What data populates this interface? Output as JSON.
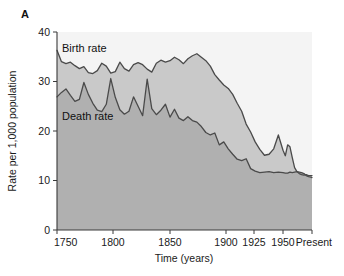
{
  "figure": {
    "panel_label": "A",
    "colors": {
      "plot_background": "#f4f4f4",
      "area_below_death": "#b0b0b0",
      "band_between": "#c9c9c9",
      "line": "#4a4a4a",
      "axis": "#3a3a3a",
      "text": "#1a1a1a"
    }
  },
  "chart_data": {
    "type": "area",
    "title": "",
    "subtitle": "",
    "xlabel": "Time (years)",
    "ylabel": "Rate per 1,000 population",
    "grid": false,
    "legend_position": "inline-annotations",
    "ylim": [
      0,
      40
    ],
    "yticks": [
      0,
      10,
      20,
      30,
      40
    ],
    "ytick_labels": [
      "0",
      "10",
      "20",
      "30",
      "40"
    ],
    "xtick_labels": [
      "1750",
      "1800",
      "1850",
      "1900",
      "1925",
      "1950",
      "Present"
    ],
    "xtick_values": [
      1750,
      1800,
      1850,
      1900,
      1925,
      1950,
      2000
    ],
    "xtick_positions_px": [
      57,
      113,
      170,
      226,
      254,
      283,
      312
    ],
    "x_axis_note": "non-linear: 50-year steps to 1900, then 25-year steps",
    "annotations": [
      {
        "name": "birth-rate-label",
        "text": "Birth rate",
        "x_px": 62,
        "y_px": 52
      },
      {
        "name": "death-rate-label",
        "text": "Death rate",
        "x_px": 62,
        "y_px": 120
      }
    ],
    "series": [
      {
        "name": "Birth rate",
        "label": "Birth rate",
        "x": [
          1750,
          1754,
          1758,
          1762,
          1766,
          1770,
          1774,
          1778,
          1782,
          1786,
          1790,
          1794,
          1798,
          1802,
          1806,
          1810,
          1814,
          1818,
          1822,
          1826,
          1830,
          1834,
          1838,
          1842,
          1846,
          1850,
          1854,
          1858,
          1862,
          1866,
          1870,
          1874,
          1878,
          1882,
          1886,
          1890,
          1894,
          1898,
          1902,
          1906,
          1910,
          1914,
          1918,
          1922,
          1926,
          1930,
          1934,
          1938,
          1942,
          1946,
          1950,
          1954,
          1958,
          1962,
          1966,
          1970,
          1974,
          1978,
          1982,
          1986,
          1990,
          1994,
          1998,
          2000
        ],
        "values": [
          36.3,
          34.0,
          33.6,
          33.9,
          33.2,
          32.6,
          33.0,
          31.8,
          31.6,
          32.2,
          33.7,
          33.1,
          31.7,
          32.0,
          33.9,
          32.6,
          32.1,
          33.4,
          33.8,
          33.4,
          32.5,
          31.9,
          33.7,
          34.3,
          33.9,
          34.2,
          34.9,
          34.4,
          33.6,
          34.6,
          35.2,
          35.6,
          34.9,
          34.2,
          33.1,
          31.4,
          30.3,
          29.3,
          28.6,
          27.4,
          25.6,
          24.0,
          21.4,
          19.8,
          17.8,
          16.3,
          15.1,
          15.3,
          16.4,
          19.2,
          16.1,
          15.0,
          17.2,
          16.8,
          14.6,
          12.6,
          11.8,
          11.4,
          11.2,
          11.1,
          11.2,
          11.0,
          11.0,
          11.0
        ]
      },
      {
        "name": "Death rate",
        "label": "Death rate",
        "x": [
          1750,
          1754,
          1758,
          1762,
          1766,
          1770,
          1774,
          1778,
          1782,
          1786,
          1790,
          1794,
          1798,
          1802,
          1806,
          1810,
          1814,
          1818,
          1822,
          1826,
          1830,
          1834,
          1838,
          1842,
          1846,
          1850,
          1854,
          1858,
          1862,
          1866,
          1870,
          1874,
          1878,
          1882,
          1886,
          1890,
          1894,
          1898,
          1902,
          1906,
          1910,
          1914,
          1918,
          1922,
          1926,
          1930,
          1934,
          1938,
          1942,
          1946,
          1950,
          1954,
          1958,
          1962,
          1966,
          1970,
          1974,
          1978,
          1982,
          1986,
          1990,
          1994,
          1998,
          2000
        ],
        "values": [
          26.9,
          27.8,
          28.5,
          27.2,
          26.0,
          26.4,
          29.8,
          27.4,
          25.6,
          24.2,
          23.9,
          25.4,
          30.6,
          26.8,
          24.3,
          23.4,
          24.0,
          26.9,
          25.0,
          23.1,
          30.5,
          24.5,
          23.3,
          24.2,
          25.4,
          22.8,
          24.4,
          22.6,
          22.1,
          22.9,
          22.1,
          21.8,
          20.9,
          19.7,
          19.2,
          19.6,
          17.2,
          17.8,
          16.4,
          15.3,
          14.3,
          14.0,
          14.4,
          12.4,
          11.9,
          11.6,
          11.7,
          11.8,
          11.6,
          11.7,
          11.6,
          11.5,
          11.5,
          11.7,
          11.6,
          11.7,
          11.8,
          11.7,
          11.6,
          11.4,
          11.0,
          10.8,
          10.7,
          10.6
        ]
      }
    ]
  }
}
